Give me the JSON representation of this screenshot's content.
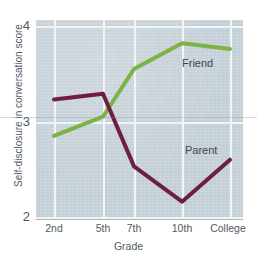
{
  "chart_data": {
    "type": "line",
    "title": "",
    "xlabel": "Grade",
    "ylabel": "Self-disclosure in conversation score",
    "categories": [
      "2nd",
      "5th",
      "7th",
      "10th",
      "College"
    ],
    "ylim": [
      2,
      4
    ],
    "yticks": [
      2,
      3,
      4
    ],
    "grid": true,
    "legend_position": "inline-annotation",
    "series": [
      {
        "name": "Friend",
        "color": "#7cb342",
        "values": [
          2.85,
          3.05,
          3.55,
          3.82,
          3.76
        ]
      },
      {
        "name": "Parent",
        "color": "#6e1f3f",
        "values": [
          3.23,
          3.29,
          2.53,
          2.16,
          2.6
        ]
      }
    ],
    "annotations": [
      {
        "text": "Friend",
        "series": "Friend"
      },
      {
        "text": "Parent",
        "series": "Parent"
      }
    ]
  },
  "axes": {
    "y_tick_labels": [
      "4",
      "3",
      "2"
    ],
    "x_tick_labels": [
      "2nd",
      "5th",
      "7th",
      "10th",
      "College"
    ],
    "x_title": "Grade",
    "y_title": "Self-disclosure in conversation score"
  },
  "colors": {
    "panel_background": "#c3ced6",
    "gridline": "#f2f5f7",
    "friend_line": "#7cb342",
    "parent_line": "#6e1f3f",
    "text": "#4f5a62"
  }
}
